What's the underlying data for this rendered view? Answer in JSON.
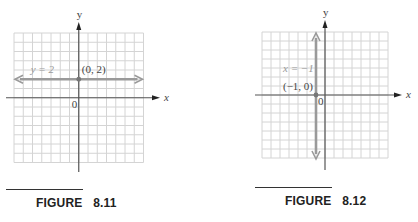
{
  "figures": [
    {
      "caption": "FIGURE   8.11",
      "x_axis_label": "x",
      "y_axis_label": "y",
      "origin_label": "0",
      "equation_label": "y = 2",
      "point_label": "(0, 2)"
    },
    {
      "caption": "FIGURE   8.12",
      "x_axis_label": "x",
      "y_axis_label": "y",
      "origin_label": "0",
      "equation_label": "x = −1",
      "point_label": "(−1, 0)"
    }
  ],
  "chart_data": [
    {
      "type": "line",
      "title": "FIGURE 8.11",
      "xlabel": "x",
      "ylabel": "y",
      "xlim": [
        -7,
        7
      ],
      "ylim": [
        -7,
        7
      ],
      "grid": true,
      "series": [
        {
          "name": "y = 2",
          "kind": "horizontal",
          "value": 2,
          "color": "#9a9a9a"
        }
      ],
      "points": [
        {
          "label": "(0, 2)",
          "x": 0,
          "y": 2
        }
      ],
      "annotations": [
        "y = 2",
        "(0, 2)",
        "0"
      ]
    },
    {
      "type": "line",
      "title": "FIGURE 8.12",
      "xlabel": "x",
      "ylabel": "y",
      "xlim": [
        -7,
        7
      ],
      "ylim": [
        -7,
        7
      ],
      "grid": true,
      "series": [
        {
          "name": "x = −1",
          "kind": "vertical",
          "value": -1,
          "color": "#9a9a9a"
        }
      ],
      "points": [
        {
          "label": "(−1, 0)",
          "x": -1,
          "y": 0
        }
      ],
      "annotations": [
        "x = −1",
        "(−1, 0)",
        "0"
      ]
    }
  ]
}
